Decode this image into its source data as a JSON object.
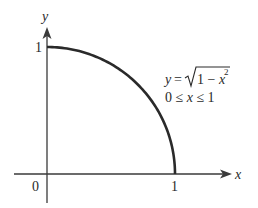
{
  "figure": {
    "type": "quarter-circle plot",
    "axes": {
      "x_label": "x",
      "y_label": "y",
      "origin_label": "0",
      "x_tick_label": "1",
      "y_tick_label": "1"
    },
    "equation": {
      "lhs": "y",
      "equals": "=",
      "sqrt_content": "1 − x",
      "exponent": "2",
      "domain_text": "0 ≤ x ≤ 1"
    },
    "curve": {
      "function": "y = sqrt(1 - x^2)",
      "x_range": [
        0,
        1
      ],
      "color": "#2a2a2a"
    },
    "colors": {
      "axis": "#3a3a3a",
      "text": "#2a2a2a",
      "background": "#ffffff"
    }
  }
}
